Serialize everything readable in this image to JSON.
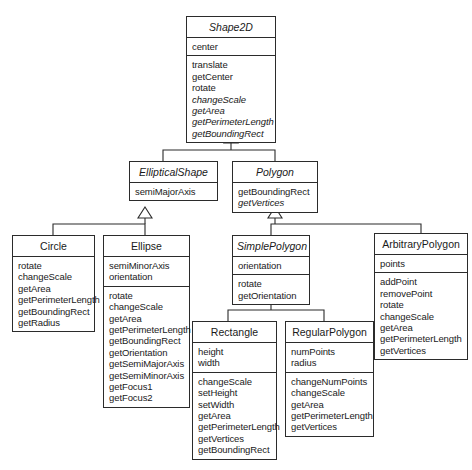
{
  "diagram": {
    "kind": "uml-class-diagram",
    "background_color": "#ffffff",
    "line_color": "#2b2b2b",
    "relationship_type": "generalization",
    "classes": [
      {
        "id": "shape2d",
        "name": "Shape2D",
        "abstract": true,
        "attributes": [
          "center"
        ],
        "operations": [
          "translate",
          "getCenter",
          "rotate",
          "changeScale",
          "getArea",
          "getPerimeterLength",
          "getBoundingRect"
        ],
        "abstract_operations": [
          "changeScale",
          "getArea",
          "getPerimeterLength",
          "getBoundingRect"
        ]
      },
      {
        "id": "ellipticalshape",
        "name": "EllipticalShape",
        "abstract": true,
        "attributes": [
          "semiMajorAxis"
        ],
        "operations": []
      },
      {
        "id": "polygon",
        "name": "Polygon",
        "abstract": true,
        "attributes": [],
        "operations": [
          "getBoundingRect",
          "getVertices"
        ],
        "abstract_operations": [
          "getVertices"
        ]
      },
      {
        "id": "circle",
        "name": "Circle",
        "abstract": false,
        "attributes": [],
        "operations": [
          "rotate",
          "changeScale",
          "getArea",
          "getPerimeterLength",
          "getBoundingRect",
          "getRadius"
        ]
      },
      {
        "id": "ellipse",
        "name": "Ellipse",
        "abstract": false,
        "attributes": [
          "semiMinorAxis",
          "orientation"
        ],
        "operations": [
          "rotate",
          "changeScale",
          "getArea",
          "getPerimeterLength",
          "getBoundingRect",
          "getOrientation",
          "getSemiMajorAxis",
          "getSemiMinorAxis",
          "getFocus1",
          "getFocus2"
        ]
      },
      {
        "id": "simplepolygon",
        "name": "SimplePolygon",
        "abstract": true,
        "attributes": [
          "orientation"
        ],
        "operations": [
          "rotate",
          "getOrientation"
        ]
      },
      {
        "id": "arbitrarypolygon",
        "name": "ArbitraryPolygon",
        "abstract": false,
        "attributes": [
          "points"
        ],
        "operations": [
          "addPoint",
          "removePoint",
          "rotate",
          "changeScale",
          "getArea",
          "getPerimeterLength",
          "getVertices"
        ]
      },
      {
        "id": "rectangle",
        "name": "Rectangle",
        "abstract": false,
        "attributes": [
          "height",
          "width"
        ],
        "operations": [
          "changeScale",
          "setHeight",
          "setWidth",
          "getArea",
          "getPerimeterLength",
          "getVertices",
          "getBoundingRect"
        ]
      },
      {
        "id": "regularpolygon",
        "name": "RegularPolygon",
        "abstract": false,
        "attributes": [
          "numPoints",
          "radius"
        ],
        "operations": [
          "changeNumPoints",
          "changeScale",
          "getArea",
          "getPerimeterLength",
          "getVertices"
        ]
      }
    ],
    "generalizations": [
      {
        "child": "ellipticalshape",
        "parent": "shape2d"
      },
      {
        "child": "polygon",
        "parent": "shape2d"
      },
      {
        "child": "circle",
        "parent": "ellipticalshape"
      },
      {
        "child": "ellipse",
        "parent": "ellipticalshape"
      },
      {
        "child": "simplepolygon",
        "parent": "polygon"
      },
      {
        "child": "arbitrarypolygon",
        "parent": "polygon"
      },
      {
        "child": "rectangle",
        "parent": "simplepolygon"
      },
      {
        "child": "regularpolygon",
        "parent": "simplepolygon"
      }
    ]
  }
}
